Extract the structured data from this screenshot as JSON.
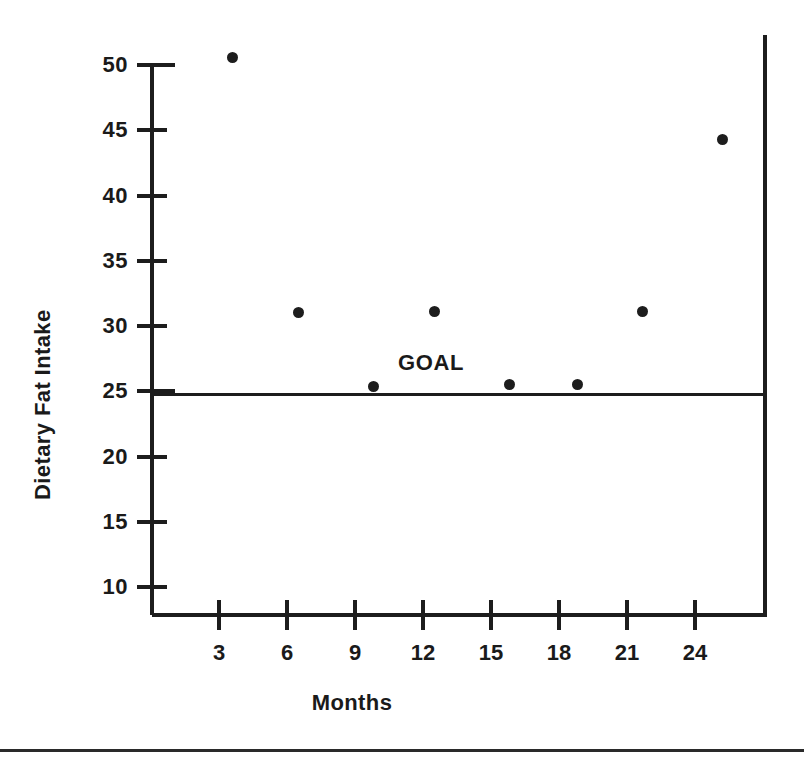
{
  "chart_data": {
    "type": "scatter",
    "title": "",
    "xlabel": "Months",
    "ylabel": "Dietary Fat Intake",
    "xlim": [
      0,
      27
    ],
    "ylim": [
      7.5,
      52
    ],
    "grid": false,
    "legend": "none",
    "x_ticks": [
      3,
      6,
      9,
      12,
      15,
      18,
      21,
      24
    ],
    "x_tick_labels": [
      "3",
      "6",
      "9",
      "12",
      "15",
      "18",
      "21",
      "24"
    ],
    "y_ticks": [
      10,
      15,
      20,
      25,
      30,
      35,
      40,
      45,
      50
    ],
    "y_tick_labels": [
      "10",
      "15",
      "20",
      "25",
      "30",
      "35",
      "40",
      "45",
      "50"
    ],
    "points": [
      {
        "x": 3.6,
        "y": 50.6
      },
      {
        "x": 6.5,
        "y": 31.0
      },
      {
        "x": 9.8,
        "y": 25.4
      },
      {
        "x": 12.5,
        "y": 31.1
      },
      {
        "x": 15.8,
        "y": 25.5
      },
      {
        "x": 18.8,
        "y": 25.5
      },
      {
        "x": 21.7,
        "y": 31.1
      },
      {
        "x": 25.2,
        "y": 44.3
      }
    ],
    "annotations": [
      {
        "label": "GOAL",
        "y": 24.8,
        "kind": "horizontal-reference-line"
      }
    ],
    "marker_color": "#1d1d1d",
    "axis_color": "#1d1d1d"
  }
}
